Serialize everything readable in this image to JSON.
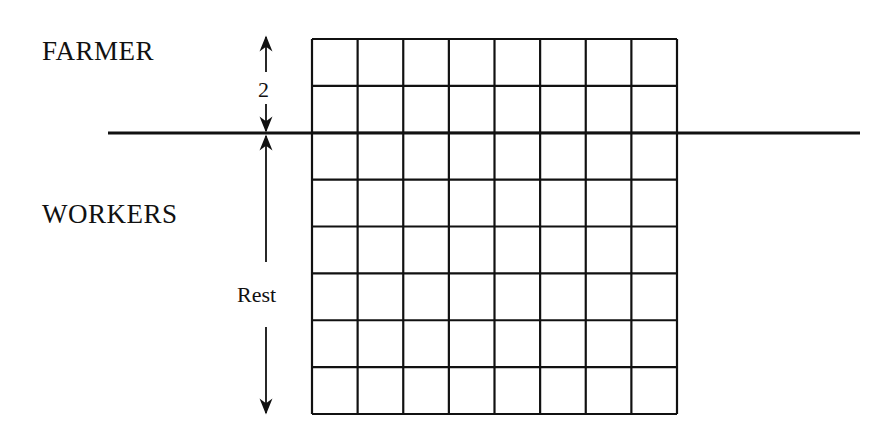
{
  "diagram": {
    "groups": [
      {
        "id": "farmer",
        "label": "FARMER",
        "size_label": "2",
        "rows": 2
      },
      {
        "id": "workers",
        "label": "WORKERS",
        "size_label": "Rest",
        "rows": 6
      }
    ],
    "grid": {
      "columns": 8,
      "rows": 8,
      "left": 312,
      "top": 39,
      "right": 677,
      "bottom": 414
    },
    "divider": {
      "y": 133,
      "x_start": 108,
      "x_end": 860
    },
    "arrow_x": 266,
    "colors": {
      "line": "#111111",
      "background": "#ffffff"
    }
  }
}
